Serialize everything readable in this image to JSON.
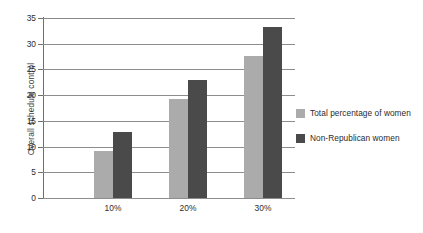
{
  "chart_data": {
    "type": "bar",
    "title": "",
    "xlabel": "",
    "ylabel": "Overall schedule control",
    "categories": [
      "10%",
      "20%",
      "30%"
    ],
    "series": [
      {
        "name": "Total percentage of women",
        "color": "#ababab",
        "values": [
          9.1,
          19.3,
          27.7
        ]
      },
      {
        "name": "Non-Republican women",
        "color": "#4a4a4a",
        "values": [
          12.8,
          23.0,
          33.3
        ]
      }
    ],
    "ylim": [
      0,
      35
    ],
    "ytick_values": [
      0,
      5,
      10,
      15,
      20,
      25,
      30,
      35
    ],
    "ytick_labels": [
      "0",
      "5",
      "10",
      "15",
      "20",
      "25",
      "30",
      "35"
    ],
    "grid": true,
    "grid_axis": "y",
    "legend_position": "right"
  },
  "legend": {
    "items": [
      {
        "label": "Total percentage of women",
        "color": "#ababab",
        "swatch_name": "legend-swatch-total-percentage-of-women"
      },
      {
        "label": "Non-Republican women",
        "color": "#4a4a4a",
        "swatch_name": "legend-swatch-non-republican-women"
      }
    ]
  },
  "colors": {
    "series_light": "#ababab",
    "series_dark": "#4a4a4a",
    "gridline": "#8d8d8d",
    "axis": "#6e6e6e",
    "text": "#2d2d2d",
    "background": "#ffffff"
  }
}
